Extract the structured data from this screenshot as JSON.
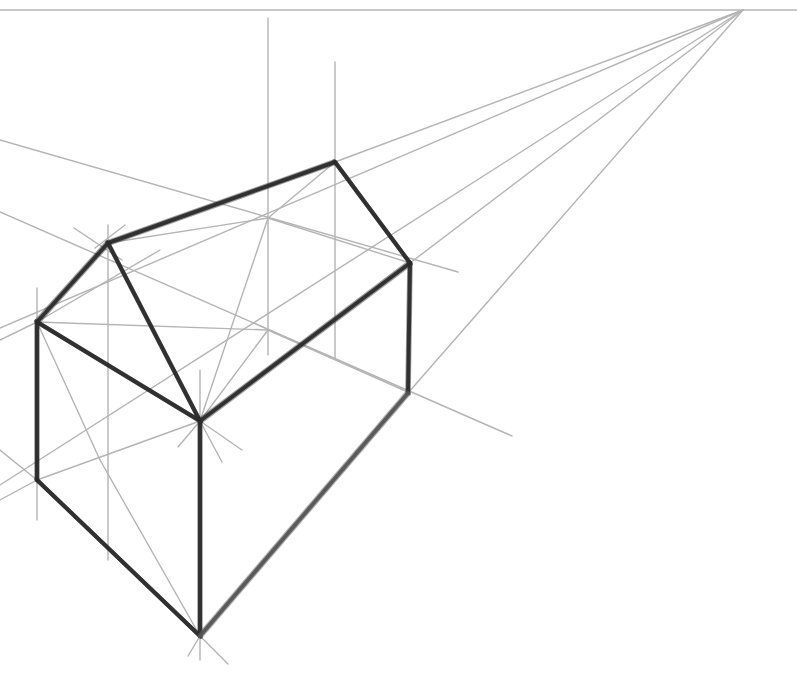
{
  "drawing": {
    "subject": "two-point perspective house sketch",
    "canvas": {
      "width": 797,
      "height": 684,
      "background": "#ffffff"
    },
    "colors": {
      "guide": "#b4b4b4",
      "edge": "#2a2a2a",
      "edge_soft": "#555555"
    },
    "horizon": {
      "y": 10,
      "x1": 0,
      "x2": 797
    },
    "vanishing_point": {
      "x": 743,
      "y": 10
    },
    "guides": [
      [
        0,
        10,
        797,
        10
      ],
      [
        743,
        10,
        335,
        162
      ],
      [
        743,
        10,
        410,
        263
      ],
      [
        743,
        10,
        408,
        393
      ],
      [
        743,
        10,
        0,
        328
      ],
      [
        743,
        10,
        0,
        485
      ],
      [
        268,
        18,
        268,
        355
      ],
      [
        335,
        62,
        335,
        358
      ],
      [
        108,
        225,
        108,
        560
      ],
      [
        37,
        288,
        37,
        520
      ],
      [
        0,
        140,
        458,
        272
      ],
      [
        0,
        212,
        512,
        436
      ],
      [
        74,
        228,
        122,
        260
      ],
      [
        125,
        225,
        95,
        248
      ],
      [
        0,
        340,
        37,
        322
      ],
      [
        37,
        322,
        100,
        460
      ],
      [
        100,
        460,
        200,
        636
      ],
      [
        37,
        322,
        160,
        250
      ],
      [
        268,
        218,
        410,
        263
      ],
      [
        268,
        218,
        200,
        421
      ],
      [
        268,
        218,
        108,
        243
      ],
      [
        268,
        218,
        335,
        162
      ],
      [
        268,
        330,
        410,
        393
      ],
      [
        268,
        330,
        200,
        421
      ],
      [
        268,
        330,
        37,
        322
      ],
      [
        0,
        450,
        37,
        480
      ],
      [
        0,
        500,
        37,
        480
      ],
      [
        37,
        480,
        200,
        421
      ],
      [
        200,
        370,
        200,
        421
      ],
      [
        178,
        447,
        200,
        421
      ],
      [
        242,
        450,
        200,
        421
      ],
      [
        222,
        462,
        200,
        421
      ],
      [
        200,
        636,
        188,
        656
      ],
      [
        200,
        636,
        228,
        664
      ],
      [
        200,
        636,
        200,
        660
      ]
    ],
    "edges": [
      {
        "name": "ridge",
        "pts": [
          108,
          243,
          335,
          162
        ]
      },
      {
        "name": "back-gable-right",
        "pts": [
          335,
          162,
          410,
          263
        ]
      },
      {
        "name": "front-gable-left",
        "pts": [
          37,
          322,
          108,
          243
        ]
      },
      {
        "name": "front-gable-right",
        "pts": [
          108,
          243,
          200,
          421
        ]
      },
      {
        "name": "front-eave",
        "pts": [
          37,
          322,
          200,
          421
        ]
      },
      {
        "name": "side-eave",
        "pts": [
          200,
          421,
          410,
          263
        ]
      },
      {
        "name": "front-left-wall",
        "pts": [
          37,
          322,
          37,
          480
        ]
      },
      {
        "name": "front-corner",
        "pts": [
          200,
          421,
          200,
          636
        ]
      },
      {
        "name": "back-right-wall",
        "pts": [
          410,
          263,
          408,
          393
        ]
      },
      {
        "name": "front-base",
        "pts": [
          37,
          480,
          200,
          636
        ]
      },
      {
        "name": "side-base",
        "pts": [
          200,
          636,
          408,
          393
        ],
        "soft": true
      }
    ]
  }
}
